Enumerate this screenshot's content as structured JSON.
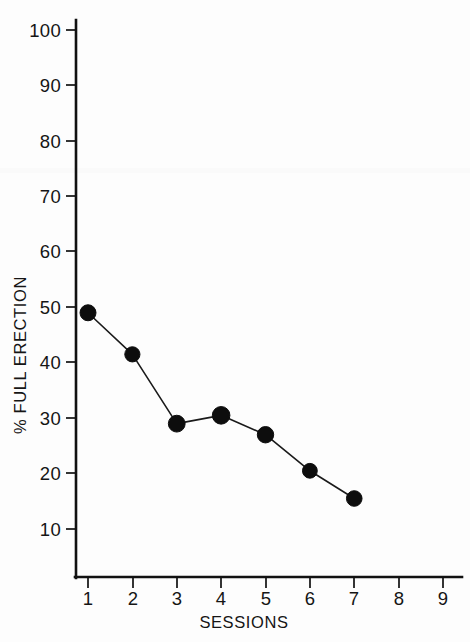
{
  "chart_data": {
    "type": "line",
    "title": "",
    "subtitle": "",
    "xlabel": "SESSIONS",
    "ylabel": "% FULL ERECTION",
    "x": [
      1,
      2,
      3,
      4,
      5,
      6,
      7
    ],
    "values": [
      49,
      41.5,
      29,
      30.5,
      27,
      20.5,
      15.5
    ],
    "series": [
      {
        "name": "% Full Erection",
        "values": [
          49,
          41.5,
          29,
          30.5,
          27,
          20.5,
          15.5
        ]
      }
    ],
    "xlim": [
      0.45,
      9.55
    ],
    "ylim": [
      0,
      104
    ],
    "xticks": [
      1,
      2,
      3,
      4,
      5,
      6,
      7,
      8,
      9
    ],
    "yticks": [
      10,
      20,
      30,
      40,
      50,
      60,
      70,
      80,
      90,
      100
    ],
    "xtick_labels": [
      "1",
      "2",
      "3",
      "4",
      "5",
      "6",
      "7",
      "8",
      "9"
    ],
    "ytick_labels": [
      "10",
      "20",
      "30",
      "40",
      "50",
      "60",
      "70",
      "80",
      "90",
      "100"
    ],
    "grid": false,
    "legend": null,
    "legend_position": "none",
    "marker": "filled-circle",
    "line_color": "#1a1a1a",
    "marker_color": "#0d0d0d",
    "background_color": "#fdfdfd",
    "annotations": []
  },
  "axes": {
    "y_axis_title": "% FULL ERECTION",
    "x_axis_title": "SESSIONS"
  },
  "ticks": {
    "y": [
      {
        "label": "100",
        "value": 100
      },
      {
        "label": "90",
        "value": 90
      },
      {
        "label": "80",
        "value": 80
      },
      {
        "label": "70",
        "value": 70
      },
      {
        "label": "60",
        "value": 60
      },
      {
        "label": "50",
        "value": 50
      },
      {
        "label": "40",
        "value": 40
      },
      {
        "label": "30",
        "value": 30
      },
      {
        "label": "20",
        "value": 20
      },
      {
        "label": "10",
        "value": 10
      }
    ],
    "x": [
      {
        "label": "1",
        "value": 1
      },
      {
        "label": "2",
        "value": 2
      },
      {
        "label": "3",
        "value": 3
      },
      {
        "label": "4",
        "value": 4
      },
      {
        "label": "5",
        "value": 5
      },
      {
        "label": "6",
        "value": 6
      },
      {
        "label": "7",
        "value": 7
      },
      {
        "label": "8",
        "value": 8
      },
      {
        "label": "9",
        "value": 9
      }
    ]
  },
  "caption": {
    "text": ""
  }
}
